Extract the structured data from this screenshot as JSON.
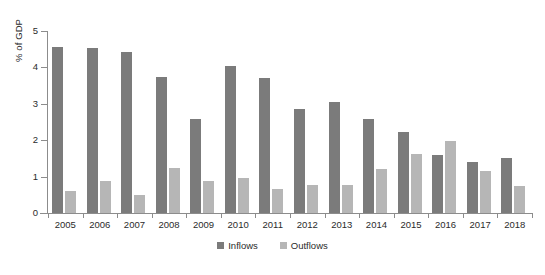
{
  "chart_data": {
    "type": "bar",
    "title": "",
    "xlabel": "",
    "ylabel": "% of GDP",
    "ylim": [
      0,
      5
    ],
    "yticks": [
      0,
      1,
      2,
      3,
      4,
      5
    ],
    "ytick_labels": [
      "0",
      "1",
      "2",
      "3",
      "4",
      "5"
    ],
    "grid": false,
    "legend_position": "bottom-center",
    "categories": [
      "2005",
      "2006",
      "2007",
      "2008",
      "2009",
      "2010",
      "2011",
      "2012",
      "2013",
      "2014",
      "2015",
      "2016",
      "2017",
      "2018"
    ],
    "series": [
      {
        "name": "Inflows",
        "color": "#7b7b7b",
        "values": [
          4.57,
          4.52,
          4.42,
          3.74,
          2.57,
          4.03,
          3.72,
          2.85,
          3.06,
          2.58,
          2.23,
          1.6,
          1.39,
          1.52
        ]
      },
      {
        "name": "Outflows",
        "color": "#b6b6b6",
        "values": [
          0.6,
          0.88,
          0.5,
          1.24,
          0.87,
          0.97,
          0.67,
          0.77,
          0.78,
          1.2,
          1.61,
          1.98,
          1.16,
          0.73
        ]
      }
    ]
  },
  "legend": {
    "items": [
      {
        "label": "Inflows",
        "color": "#7b7b7b"
      },
      {
        "label": "Outflows",
        "color": "#b6b6b6"
      }
    ]
  },
  "axes": {
    "y_title": "% of GDP"
  }
}
